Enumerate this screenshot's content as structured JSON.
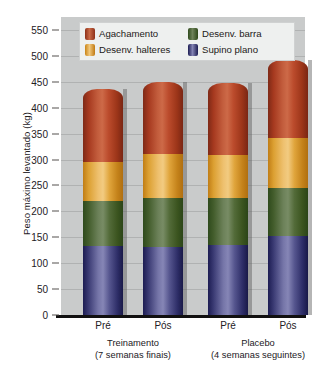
{
  "chart_data": {
    "type": "bar",
    "subtype": "stacked-column",
    "title": "",
    "xlabel": "",
    "ylabel": "Peso máximo levantado (kg)",
    "ylim": [
      0,
      575
    ],
    "yticks": [
      0,
      50,
      100,
      150,
      200,
      250,
      300,
      350,
      400,
      450,
      500,
      550
    ],
    "grid": true,
    "legend_position": "top-inside",
    "categories": [
      "Pré",
      "Pós",
      "Pré",
      "Pós"
    ],
    "groups": [
      {
        "name": "Treinamento",
        "sub": "(7 semanas finais)",
        "categories": [
          "Pré",
          "Pós"
        ]
      },
      {
        "name": "Placebo",
        "sub": "(4 semanas seguintes)",
        "categories": [
          "Pré",
          "Pós"
        ]
      }
    ],
    "series": [
      {
        "name": "Supino plano",
        "color": "#4a4a8c",
        "values": [
          133,
          132,
          135,
          152
        ]
      },
      {
        "name": "Desenv. barra",
        "color": "#4f6b37",
        "values": [
          87,
          93,
          90,
          93
        ]
      },
      {
        "name": "Desenv. halteres",
        "color": "#e09b36",
        "values": [
          75,
          85,
          83,
          97
        ]
      },
      {
        "name": "Agachamento",
        "color": "#b5432a",
        "values": [
          142,
          140,
          140,
          150
        ]
      }
    ],
    "stack_order_bottom_to_top": [
      "Supino plano",
      "Desenv. barra",
      "Desenv. halteres",
      "Agachamento"
    ],
    "totals": [
      437,
      450,
      448,
      492
    ]
  },
  "axis": {
    "y_title": "Peso máximo levantado (kg)",
    "y_ticks": [
      "550",
      "500",
      "450",
      "400",
      "350",
      "300",
      "250",
      "200",
      "150",
      "100",
      "50",
      "0"
    ]
  },
  "legend": {
    "items": [
      {
        "label": "Agachamento",
        "swatch": "red-swatch-icon"
      },
      {
        "label": "Desenv. barra",
        "swatch": "green-swatch-icon"
      },
      {
        "label": "Desenv. halteres",
        "swatch": "orange-swatch-icon"
      },
      {
        "label": "Supino plano",
        "swatch": "purple-swatch-icon"
      }
    ]
  },
  "xaxis": {
    "ticks": [
      "Pré",
      "Pós",
      "Pré",
      "Pós"
    ],
    "groups": [
      {
        "name": "Treinamento",
        "detail": "(7 semanas finais)"
      },
      {
        "name": "Placebo",
        "detail": "(4 semanas seguintes)"
      }
    ]
  },
  "colors": {
    "plot_background": "#c9cbcb",
    "gridline": "#b0b2b2",
    "baseline": "#111010",
    "legend_background": "#eef0ef",
    "text": "#23201e"
  }
}
